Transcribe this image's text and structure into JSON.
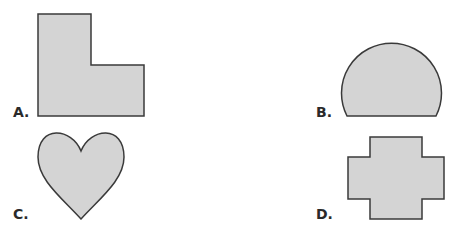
{
  "figure": {
    "type": "multiple-choice-shapes",
    "colors": {
      "fill": "#d4d4d4",
      "stroke": "#3a3a3a",
      "label": "#2a2a2a"
    },
    "options": [
      {
        "label": "A.",
        "shape": "L-shape"
      },
      {
        "label": "B.",
        "shape": "truncated-circle"
      },
      {
        "label": "C.",
        "shape": "heart"
      },
      {
        "label": "D.",
        "shape": "cross"
      }
    ]
  }
}
